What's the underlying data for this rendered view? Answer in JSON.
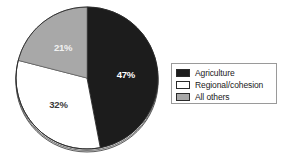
{
  "chart_data": {
    "type": "pie",
    "title": "",
    "subtitle": "",
    "xlabel": "",
    "ylabel": "",
    "legend_position": "right",
    "grid": false,
    "start_angle_deg": 0,
    "direction": "clockwise",
    "categories": [
      "Agriculture",
      "Regional/cohesion",
      "All others"
    ],
    "values": [
      47,
      32,
      21
    ],
    "value_unit": "%",
    "data_labels": [
      "47%",
      "32%",
      "21%"
    ],
    "colors": [
      "#1c1c1c",
      "#ffffff",
      "#a8a8a8"
    ],
    "slices": [
      {
        "label": "Agriculture",
        "value": 47,
        "data_label": "47%",
        "color": "#1c1c1c",
        "label_color": "#ffffff"
      },
      {
        "label": "Regional/cohesion",
        "value": 32,
        "data_label": "32%",
        "color": "#ffffff",
        "label_color": "#3a3a3a"
      },
      {
        "label": "All others",
        "value": 21,
        "data_label": "21%",
        "color": "#a8a8a8",
        "label_color": "#f2f2f2"
      }
    ]
  },
  "legend": {
    "items": [
      {
        "label": "Agriculture",
        "swatch_color": "#1c1c1c"
      },
      {
        "label": "Regional/cohesion",
        "swatch_color": "#ffffff"
      },
      {
        "label": "All others",
        "swatch_color": "#a8a8a8"
      }
    ]
  },
  "style": {
    "background": "#ffffff",
    "outline": "#2a2a2a",
    "legend_border": "#9a9a9a"
  }
}
